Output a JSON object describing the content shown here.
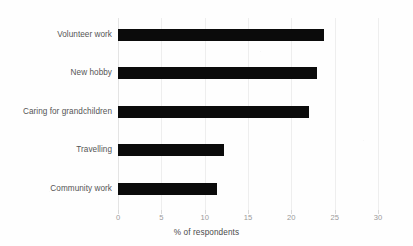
{
  "chart_data": {
    "type": "bar",
    "orientation": "horizontal",
    "title": "",
    "xlabel": "% of respondents",
    "ylabel": "",
    "categories": [
      "Volunteer work",
      "New hobby",
      "Caring for grandchildren",
      "Travelling",
      "Community work"
    ],
    "values": [
      23.8,
      23.0,
      22.0,
      12.2,
      11.4
    ],
    "xlim": [
      0,
      30
    ],
    "xticks": [
      0,
      5,
      10,
      15,
      20,
      25,
      30
    ],
    "xtick_labels": [
      "0",
      "5",
      "10",
      "15",
      "20",
      "25",
      "30"
    ],
    "grid": "vertical",
    "legend": "none",
    "bar_color": "#0b0b0b",
    "gridline_color": "#eeeeee",
    "tick_label_color": "#9a9a9a",
    "category_label_color": "#555555"
  }
}
